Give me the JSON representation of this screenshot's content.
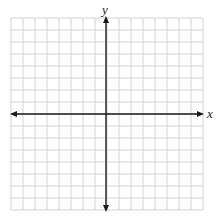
{
  "diagram": {
    "type": "coordinate-plane",
    "grid": {
      "columns": 16,
      "rows": 16,
      "cell_size_px": 12,
      "origin_col": 8,
      "origin_row": 8,
      "grid_color": "#c8c8c8",
      "axis_color": "#1a1a1a"
    },
    "axes": {
      "x_label": "x",
      "y_label": "y",
      "x_arrows": "both",
      "y_arrows": "both"
    }
  }
}
